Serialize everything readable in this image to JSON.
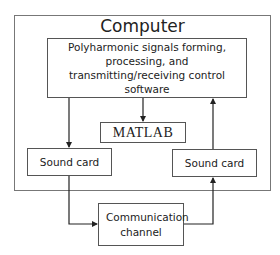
{
  "diagram": {
    "outer_box": {
      "title": "Computer"
    },
    "software_box": {
      "label": "Polyharmonic signals forming, processing, and transmitting/receiving control software"
    },
    "matlab_box": {
      "label": "MATLAB"
    },
    "sound_card_left": {
      "label": "Sound card"
    },
    "sound_card_right": {
      "label": "Sound card"
    },
    "communication_channel": {
      "label": "Communication channel"
    },
    "edges": [
      {
        "from": "software_box",
        "to": "matlab_box"
      },
      {
        "from": "software_box",
        "to": "sound_card_left"
      },
      {
        "from": "sound_card_left",
        "to": "communication_channel"
      },
      {
        "from": "communication_channel",
        "to": "sound_card_right"
      },
      {
        "from": "sound_card_right",
        "to": "software_box"
      }
    ],
    "colors": {
      "line": "#333333",
      "border": "#555555",
      "background": "#ffffff"
    }
  }
}
